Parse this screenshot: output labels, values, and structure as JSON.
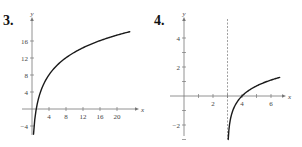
{
  "chart_data": [
    {
      "type": "line",
      "problem_number": "3.",
      "xlabel": "x",
      "ylabel": "y",
      "xticks": [
        4,
        8,
        12,
        16,
        20
      ],
      "yticks": [
        -4,
        4,
        8,
        12,
        16
      ],
      "xlim": [
        -1,
        24
      ],
      "ylim": [
        -6,
        19
      ],
      "series": [
        {
          "name": "curve",
          "function": "y ≈ 5.8 ln(x)",
          "x": [
            0.35,
            0.5,
            1,
            2,
            4,
            6,
            8,
            12,
            16,
            20,
            23
          ],
          "y": [
            -6.1,
            -4.0,
            0,
            4.0,
            8.0,
            10.4,
            12.1,
            14.4,
            16.1,
            17.4,
            18.2
          ]
        }
      ],
      "grid": false,
      "legend": false
    },
    {
      "type": "line",
      "problem_number": "4.",
      "xlabel": "x",
      "ylabel": "y",
      "xticks": [
        1,
        2,
        3,
        4,
        5,
        6
      ],
      "xtick_labels": [
        "",
        "2",
        "",
        "4",
        "",
        "6"
      ],
      "yticks": [
        -3,
        -2,
        -1,
        1,
        2,
        3,
        4
      ],
      "ytick_labels": [
        "",
        "-2",
        "",
        "",
        "2",
        "",
        "4"
      ],
      "xlim": [
        -1,
        7
      ],
      "ylim": [
        -3.2,
        4.8
      ],
      "asymptote": {
        "type": "vertical",
        "x": 3,
        "style": "dashed"
      },
      "series": [
        {
          "name": "curve",
          "function": "y = ln(x - 3)",
          "x": [
            3.05,
            3.1,
            3.2,
            3.5,
            4,
            4.5,
            5,
            5.5,
            6,
            6.6
          ],
          "y": [
            -3.0,
            -2.3,
            -1.61,
            -0.69,
            0,
            0.41,
            0.69,
            0.92,
            1.1,
            1.28
          ]
        }
      ],
      "grid": false,
      "legend": false
    }
  ]
}
